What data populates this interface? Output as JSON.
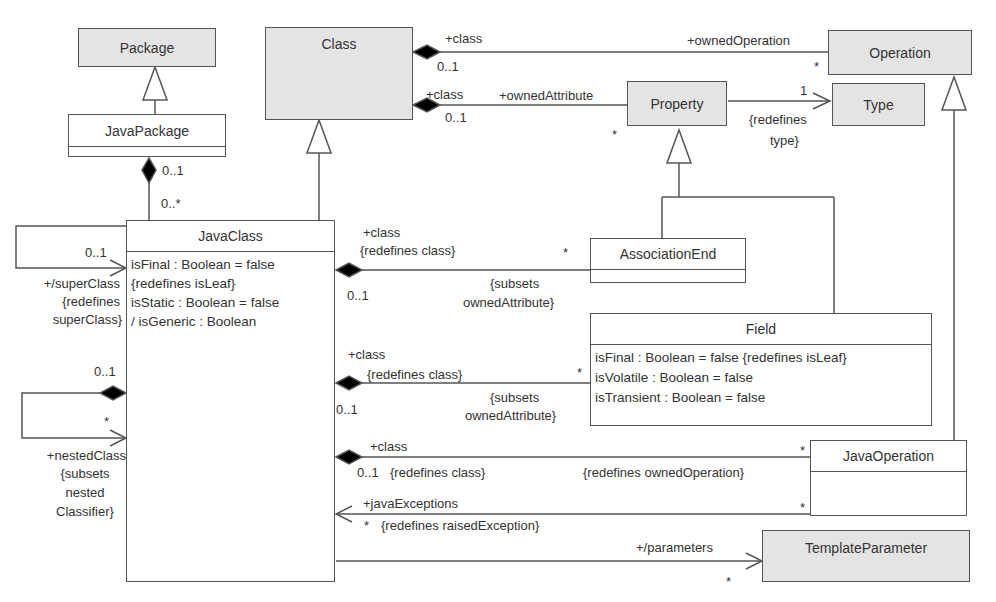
{
  "classes": {
    "package": {
      "name": "Package"
    },
    "class": {
      "name": "Class"
    },
    "operation": {
      "name": "Operation"
    },
    "property": {
      "name": "Property"
    },
    "type": {
      "name": "Type"
    },
    "java_package": {
      "name": "JavaPackage"
    },
    "java_class": {
      "name": "JavaClass",
      "attributes": [
        "isFinal : Boolean = false",
        "{redefines isLeaf}",
        "isStatic : Boolean = false",
        "/ isGeneric : Boolean"
      ]
    },
    "association_end": {
      "name": "AssociationEnd"
    },
    "field": {
      "name": "Field",
      "attributes": [
        "isFinal : Boolean = false {redefines isLeaf}",
        "isVolatile : Boolean = false",
        "isTransient : Boolean = false"
      ]
    },
    "java_operation": {
      "name": "JavaOperation"
    },
    "template_parameter": {
      "name": "TemplateParameter"
    }
  },
  "labels": {
    "class_op_class": "+class",
    "class_op_mult": "0..1",
    "owned_operation": "+ownedOperation",
    "owned_operation_mult": "*",
    "class_prop_class": "+class",
    "class_prop_mult": "0..1",
    "owned_attribute": "+ownedAttribute",
    "owned_attribute_mult": "*",
    "type_mult": "1",
    "redefines_type_1": "{redefines",
    "redefines_type_2": "type}",
    "pkg_mult_1": "0..1",
    "pkg_mult_2": "0..*",
    "super_mult": "0..1",
    "super_role_1": "+/superClass",
    "super_role_2": "{redefines",
    "super_role_3": "superClass}",
    "nested_mult_1": "0..1",
    "nested_mult_2": "*",
    "nested_role_1": "+nestedClass",
    "nested_role_2": "{subsets",
    "nested_role_3": "nested",
    "nested_role_4": "Classifier}",
    "ae_class": "+class",
    "ae_redef": "{redefines class}",
    "ae_star": "*",
    "ae_mult": "0..1",
    "ae_subsets_1": "{subsets",
    "ae_subsets_2": "ownedAttribute}",
    "f_class": "+class",
    "f_redef": "{redefines class}",
    "f_star": "*",
    "f_mult": "0..1",
    "f_subsets_1": "{subsets",
    "f_subsets_2": "ownedAttribute}",
    "jo_class": "+class",
    "jo_mult": "0..1",
    "jo_redef": "{redefines class}",
    "jo_redef_op": "{redefines ownedOperation}",
    "jo_star": "*",
    "je_role": "+javaExceptions",
    "je_mult": "*",
    "je_redef": "{redefines raisedException}",
    "je_star": "*",
    "tp_role": "+/parameters",
    "tp_mult": "*"
  }
}
